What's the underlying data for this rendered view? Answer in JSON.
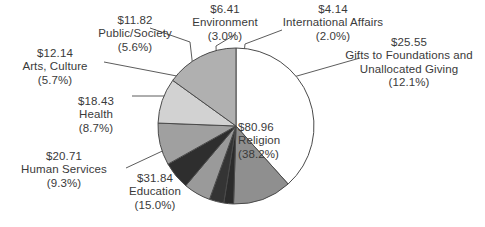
{
  "chart_data": {
    "type": "pie",
    "title": "",
    "units": "billions of dollars",
    "legend_position": "callout-labels",
    "total": 212.0,
    "categories": [
      "Religion",
      "Gifts to Foundations and Unallocated Giving",
      "International Affairs",
      "Environment",
      "Public/Society",
      "Arts, Culture",
      "Health",
      "Human Services",
      "Education"
    ],
    "values": [
      80.96,
      25.55,
      4.14,
      6.41,
      11.82,
      12.14,
      18.43,
      20.71,
      31.84
    ],
    "percents": [
      38.2,
      12.1,
      2.0,
      3.0,
      5.6,
      5.7,
      8.7,
      9.3,
      15.0
    ],
    "colors": [
      "#ffffff",
      "#8f8f8f",
      "#2b2b2b",
      "#343434",
      "#9a9a9a",
      "#2e2e2e",
      "#a0a0a0",
      "#d2d2d2",
      "#b0b0b0"
    ]
  },
  "slices": [
    {
      "key": "religion",
      "amount": "$80.96",
      "name": "Religion",
      "percent": "(38.2%)",
      "value": 80.96,
      "percent_value": 38.2,
      "color": "#ffffff"
    },
    {
      "key": "gifts-to-foundations",
      "amount": "$25.55",
      "name": "Gifts to Foundations and",
      "name2": "Unallocated Giving",
      "percent": "(12.1%)",
      "value": 25.55,
      "percent_value": 12.1,
      "color": "#8f8f8f"
    },
    {
      "key": "international-affairs",
      "amount": "$4.14",
      "name": "International Affairs",
      "percent": "(2.0%)",
      "value": 4.14,
      "percent_value": 2.0,
      "color": "#2b2b2b"
    },
    {
      "key": "environment",
      "amount": "$6.41",
      "name": "Environment",
      "percent": "(3.0%)",
      "value": 6.41,
      "percent_value": 3.0,
      "color": "#343434"
    },
    {
      "key": "public-society",
      "amount": "$11.82",
      "name": "Public/Society",
      "percent": "(5.6%)",
      "value": 11.82,
      "percent_value": 5.6,
      "color": "#9a9a9a"
    },
    {
      "key": "arts-culture",
      "amount": "$12.14",
      "name": "Arts, Culture",
      "percent": "(5.7%)",
      "value": 12.14,
      "percent_value": 5.7,
      "color": "#2e2e2e"
    },
    {
      "key": "health",
      "amount": "$18.43",
      "name": "Health",
      "percent": "(8.7%)",
      "value": 18.43,
      "percent_value": 8.7,
      "color": "#a0a0a0"
    },
    {
      "key": "human-services",
      "amount": "$20.71",
      "name": "Human Services",
      "percent": "(9.3%)",
      "value": 20.71,
      "percent_value": 9.3,
      "color": "#d2d2d2"
    },
    {
      "key": "education",
      "amount": "$31.84",
      "name": "Education",
      "percent": "(15.0%)",
      "value": 31.84,
      "percent_value": 15.0,
      "color": "#b0b0b0"
    }
  ],
  "geometry": {
    "cx": 236,
    "cy": 126,
    "r": 78,
    "start_angle_deg": -90,
    "outline_color": "#4a4a4a",
    "leader_color": "#4a4a4a"
  }
}
